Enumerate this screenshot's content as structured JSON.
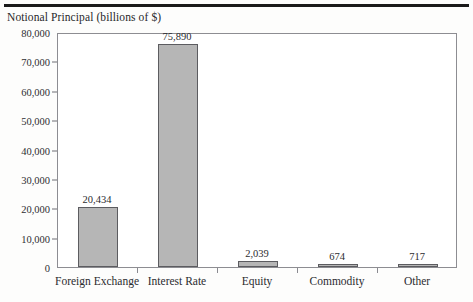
{
  "document": {
    "top_rule": "horizontal-rule"
  },
  "chart_data": {
    "type": "bar",
    "title": "Notional Principal (billions of $)",
    "xlabel": "",
    "ylabel": "Notional Principal (billions of $)",
    "categories": [
      "Foreign Exchange",
      "Interest Rate",
      "Equity",
      "Commodity",
      "Other"
    ],
    "values": [
      20434,
      75890,
      2039,
      674,
      717
    ],
    "value_labels": [
      "20,434",
      "75,890",
      "2,039",
      "674",
      "717"
    ],
    "ylim": [
      0,
      80000
    ],
    "ytick_values": [
      0,
      10000,
      20000,
      30000,
      40000,
      50000,
      60000,
      70000,
      80000
    ],
    "ytick_labels": [
      "0",
      "10,000",
      "20,000",
      "30,000",
      "40,000",
      "50,000",
      "60,000",
      "70,000",
      "80,000"
    ],
    "grid": false,
    "legend": false,
    "bar_color": "#b6b6b6",
    "bar_edge_color": "#5c5c60",
    "frame_color": "#8d8d92",
    "text_color": "#2c2c30"
  }
}
